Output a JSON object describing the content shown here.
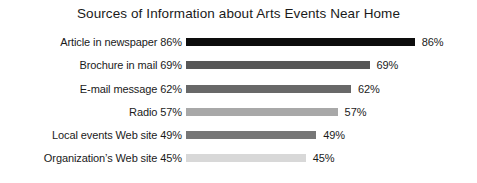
{
  "chart_data": {
    "type": "bar",
    "orientation": "horizontal",
    "title": "Sources of Information about Arts Events Near Home",
    "xlabel": "",
    "ylabel": "",
    "xlim": [
      0,
      100
    ],
    "grid": false,
    "legend": false,
    "categories": [
      "Article in newspaper",
      "Brochure in mail",
      "E-mail message",
      "Radio",
      "Local events Web site",
      "Organization’s Web site"
    ],
    "values": [
      86,
      69,
      62,
      57,
      49,
      45
    ],
    "bars": [
      {
        "category": "Article in newspaper",
        "value": 86,
        "axis_label": "Article in newspaper 86%",
        "value_label": "86%",
        "color": "#0d0d0d"
      },
      {
        "category": "Brochure in mail",
        "value": 69,
        "axis_label": "Brochure in mail 69%",
        "value_label": "69%",
        "color": "#575757"
      },
      {
        "category": "E-mail message",
        "value": 62,
        "axis_label": "E-mail message 62%",
        "value_label": "62%",
        "color": "#686868"
      },
      {
        "category": "Radio",
        "value": 57,
        "axis_label": "Radio 57%",
        "value_label": "57%",
        "color": "#a8a8a8"
      },
      {
        "category": "Local events Web site",
        "value": 49,
        "axis_label": "Local events Web site 49%",
        "value_label": "49%",
        "color": "#767676"
      },
      {
        "category": "Organization’s Web site",
        "value": 45,
        "axis_label": "Organization’s Web site 45%",
        "value_label": "45%",
        "color": "#d8d8d8"
      }
    ],
    "background_color": "#ffffff",
    "text_color": "#1a1a1a"
  }
}
